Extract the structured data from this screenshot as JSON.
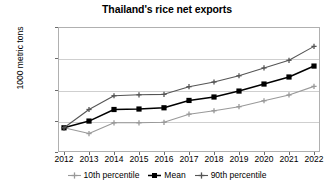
{
  "chart_data": {
    "type": "line",
    "title": "Thailand's rice net exports",
    "xlabel": "",
    "ylabel": "1000 metric tons",
    "categories": [
      "2012",
      "2013",
      "2014",
      "2015",
      "2016",
      "2017",
      "2018",
      "2019",
      "2020",
      "2021",
      "2022"
    ],
    "ylim": [
      6000,
      14000
    ],
    "ytick_values": [
      6000,
      8000,
      10000,
      12000,
      14000
    ],
    "ytick_labels": [
      "6000",
      "8000",
      "10,000",
      "12,000",
      "14,000"
    ],
    "grid": true,
    "legend_position": "bottom",
    "series": [
      {
        "name": "10th percentile",
        "color": "#999999",
        "marker": "plus",
        "values": [
          7550,
          7180,
          7870,
          7870,
          7900,
          8420,
          8640,
          8900,
          9280,
          9650,
          10200
        ]
      },
      {
        "name": "Mean",
        "color": "#000000",
        "marker": "square",
        "values": [
          7550,
          7980,
          8720,
          8750,
          8830,
          9300,
          9520,
          9900,
          10350,
          10800,
          11500
        ]
      },
      {
        "name": "90th percentile",
        "color": "#555555",
        "marker": "plus",
        "values": [
          7550,
          8720,
          9600,
          9660,
          9690,
          10180,
          10480,
          10880,
          11380,
          11870,
          12760
        ]
      }
    ]
  },
  "legend": {
    "items": [
      {
        "label": "10th percentile"
      },
      {
        "label": "Mean"
      },
      {
        "label": "90th percentile"
      }
    ]
  }
}
